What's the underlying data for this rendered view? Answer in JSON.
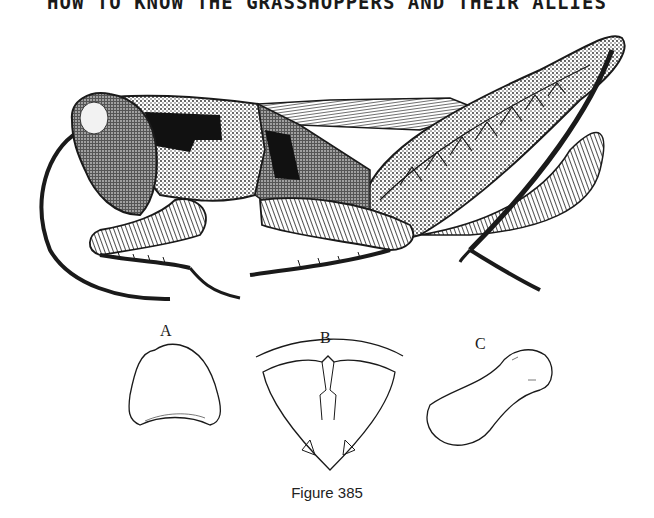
{
  "page": {
    "running_head": "HOW TO KNOW THE GRASSHOPPERS AND THEIR ALLIES"
  },
  "figure": {
    "caption": "Figure 385",
    "main_illustration": "grasshopper-lateral-view",
    "detail_labels": [
      "A",
      "B",
      "C"
    ],
    "colors": {
      "ink": "#1a1a1a",
      "paper": "#ffffff"
    }
  }
}
